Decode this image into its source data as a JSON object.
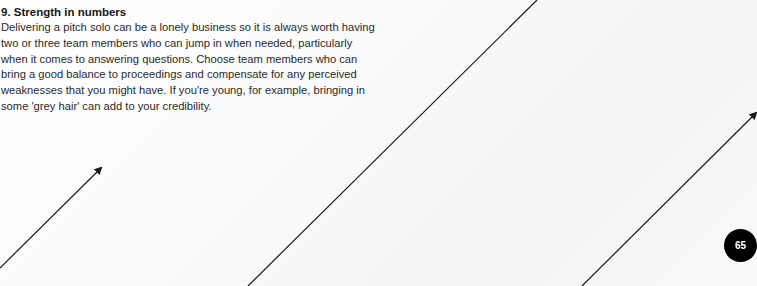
{
  "section": {
    "heading": "9. Strength in numbers",
    "body": "Delivering a pitch solo can be a lonely business so it is always worth having two or three team members who can jump in when needed, particularly when it comes to answering questions. Choose team members who can bring a good balance to proceedings and compensate for any perceived weaknesses that you might have. If you're young, for example, bringing in some 'grey hair' can add to your credibility."
  },
  "page": {
    "number": "65"
  },
  "colors": {
    "badge_bg": "#000000",
    "badge_text": "#ffffff",
    "line": "#1a1a1a"
  },
  "decorations": [
    {
      "name": "arrow-left",
      "x1": 0,
      "y1": 268,
      "x2": 101,
      "y2": 168,
      "arrowhead": true
    },
    {
      "name": "line-middle",
      "x1": 248,
      "y1": 286,
      "x2": 537,
      "y2": 0,
      "arrowhead": false
    },
    {
      "name": "arrow-right",
      "x1": 582,
      "y1": 286,
      "x2": 756,
      "y2": 113,
      "arrowhead": true
    }
  ]
}
